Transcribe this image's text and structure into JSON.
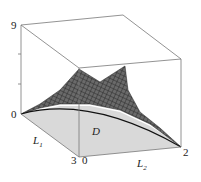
{
  "figure": {
    "type": "3d-surface-plot",
    "z_axis": {
      "min_label": "0",
      "max_label": "9"
    },
    "l1_axis": {
      "label": "L",
      "sub": "1",
      "end_label": "3"
    },
    "l2_axis": {
      "label": "L",
      "sub": "2",
      "start_label": "0",
      "end_label": "2"
    },
    "region_label": "D",
    "colors": {
      "box": "#777777",
      "surface": "#555555",
      "mesh": "#222222",
      "domain": "#d9d9d9"
    }
  }
}
